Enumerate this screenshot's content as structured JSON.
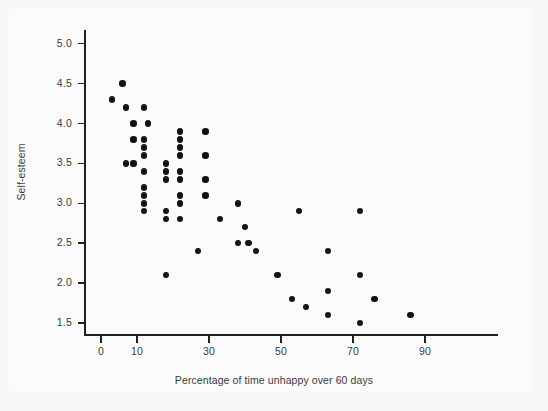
{
  "chart_data": {
    "type": "scatter",
    "title": "",
    "xlabel": "Percentage of time unhappy over 60 days",
    "ylabel": "Self-esteem",
    "xlim": [
      -2,
      98
    ],
    "ylim": [
      1.25,
      5.2
    ],
    "xticks": [
      0,
      10,
      30,
      50,
      70,
      90
    ],
    "xtick_labels": [
      "0",
      "10",
      "30",
      "50",
      "70",
      "90"
    ],
    "yticks": [
      1.5,
      2.0,
      2.5,
      3.0,
      3.5,
      4.0,
      4.5,
      5.0
    ],
    "ytick_labels": [
      "1.5",
      "2.0",
      "2.5",
      "3.0",
      "3.5",
      "4.0",
      "4.5",
      "5.0"
    ],
    "grid": false,
    "legend": false,
    "marker_color": "#16130f",
    "marker_size": 6.4,
    "points": [
      [
        3,
        4.3
      ],
      [
        6,
        4.5
      ],
      [
        7,
        4.2
      ],
      [
        7,
        3.5
      ],
      [
        9,
        4.0
      ],
      [
        9,
        3.8
      ],
      [
        9,
        3.5
      ],
      [
        12,
        4.2
      ],
      [
        12,
        3.8
      ],
      [
        12,
        3.7
      ],
      [
        12,
        3.6
      ],
      [
        12,
        3.4
      ],
      [
        12,
        3.2
      ],
      [
        12,
        3.1
      ],
      [
        12,
        3.0
      ],
      [
        12,
        2.9
      ],
      [
        13,
        4.0
      ],
      [
        18,
        3.5
      ],
      [
        18,
        3.4
      ],
      [
        18,
        3.3
      ],
      [
        18,
        2.9
      ],
      [
        18,
        2.8
      ],
      [
        18,
        2.1
      ],
      [
        22,
        3.9
      ],
      [
        22,
        3.8
      ],
      [
        22,
        3.7
      ],
      [
        22,
        3.6
      ],
      [
        22,
        3.4
      ],
      [
        22,
        3.3
      ],
      [
        22,
        3.1
      ],
      [
        22,
        3.0
      ],
      [
        22,
        2.8
      ],
      [
        27,
        2.4
      ],
      [
        29,
        3.9
      ],
      [
        29,
        3.6
      ],
      [
        29,
        3.3
      ],
      [
        29,
        3.1
      ],
      [
        33,
        2.8
      ],
      [
        38,
        3.0
      ],
      [
        38,
        2.5
      ],
      [
        40,
        2.7
      ],
      [
        41,
        2.5
      ],
      [
        43,
        2.4
      ],
      [
        49,
        2.1
      ],
      [
        53,
        1.8
      ],
      [
        55,
        2.9
      ],
      [
        57,
        1.7
      ],
      [
        63,
        2.4
      ],
      [
        63,
        1.9
      ],
      [
        63,
        1.6
      ],
      [
        72,
        2.9
      ],
      [
        72,
        2.1
      ],
      [
        72,
        1.5
      ],
      [
        76,
        1.8
      ],
      [
        86,
        1.6
      ]
    ]
  }
}
